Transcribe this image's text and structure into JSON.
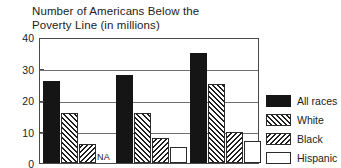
{
  "chart_data": {
    "type": "bar",
    "title": "Number of Americans Below the Poverty Line (in millions)",
    "title_lines": [
      "Number of Americans Below the",
      "Poverty Line (in millions)"
    ],
    "xlabel": "",
    "ylabel": "",
    "ylim": [
      0,
      40
    ],
    "ytick_labels": [
      "0",
      "10",
      "20",
      "30",
      "40"
    ],
    "ytick_values": [
      0,
      10,
      20,
      30,
      40
    ],
    "grid": true,
    "legend_position": "right",
    "categories": [
      "group-1",
      "group-2",
      "group-3"
    ],
    "series": [
      {
        "name": "All races",
        "pattern": "solid-black",
        "values": [
          26,
          28,
          35
        ]
      },
      {
        "name": "White",
        "pattern": "forward-hatch",
        "values": [
          16,
          16,
          25
        ]
      },
      {
        "name": "Black",
        "pattern": "backward-hatch",
        "values": [
          6,
          8,
          10
        ]
      },
      {
        "name": "Hispanic",
        "pattern": "open-white",
        "values": [
          null,
          5,
          7
        ]
      }
    ],
    "annotations": [
      {
        "text": "NA",
        "series": "Hispanic",
        "category": "group-1"
      }
    ]
  },
  "legend": {
    "items": [
      {
        "label": "All races",
        "pattern": "allraces"
      },
      {
        "label": "White",
        "pattern": "white"
      },
      {
        "label": "Black",
        "pattern": "black"
      },
      {
        "label": "Hispanic",
        "pattern": "hispanic"
      }
    ]
  },
  "colors": {
    "ink": "#151515",
    "frame": "#4a4a4a",
    "grid": "#6f6f6f",
    "background": "#ffffff"
  }
}
